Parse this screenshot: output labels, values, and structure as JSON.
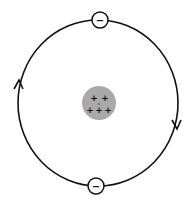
{
  "diagram": {
    "type": "atom-model",
    "nucleus": {
      "fill": "#a9a9a9",
      "charges": [
        "+",
        "+",
        "+",
        "+",
        "+"
      ],
      "charge_count": 5
    },
    "orbit": {
      "stroke": "#111111",
      "direction": "clockwise"
    },
    "electrons": [
      {
        "position": "top",
        "charge": "−"
      },
      {
        "position": "bottom",
        "charge": "−"
      }
    ],
    "arrows": [
      {
        "position": "left",
        "direction": "up"
      },
      {
        "position": "right",
        "direction": "down"
      }
    ]
  }
}
